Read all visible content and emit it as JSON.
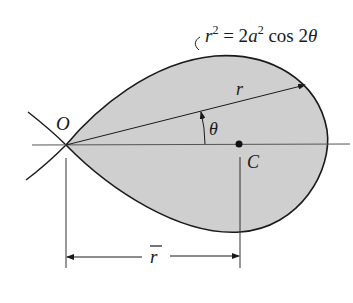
{
  "figure": {
    "equation": {
      "lhs_var": "r",
      "lhs_exp": "2",
      "mid": " = 2",
      "a_var": "a",
      "a_exp": "2",
      "rhs": " cos 2",
      "theta": "θ"
    },
    "labels": {
      "origin": "O",
      "centroid": "C",
      "radius": "r",
      "angle": "θ",
      "rbar": "r"
    },
    "colors": {
      "fill": "#cfcfcf",
      "stroke": "#1a1a1a",
      "axis": "#555555"
    }
  }
}
